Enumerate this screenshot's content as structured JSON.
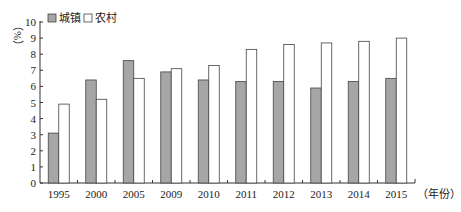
{
  "chart_data": {
    "type": "bar",
    "title": "",
    "xlabel": "（年份）",
    "ylabel": "（%）",
    "ylim": [
      0,
      10
    ],
    "yticks": [
      0,
      1,
      2,
      3,
      4,
      5,
      6,
      7,
      8,
      9,
      10
    ],
    "categories": [
      "1995",
      "2000",
      "2005",
      "2009",
      "2010",
      "2011",
      "2012",
      "2013",
      "2014",
      "2015"
    ],
    "series": [
      {
        "name": "城镇",
        "color": "#a6a6a6",
        "values": [
          3.1,
          6.4,
          7.6,
          6.9,
          6.4,
          6.3,
          6.3,
          5.9,
          6.3,
          6.5
        ]
      },
      {
        "name": "农村",
        "color": "#ffffff",
        "values": [
          4.9,
          5.2,
          6.5,
          7.1,
          7.3,
          8.3,
          8.6,
          8.7,
          8.8,
          9.0
        ]
      }
    ],
    "legend_position": "top-left",
    "grid": false
  }
}
